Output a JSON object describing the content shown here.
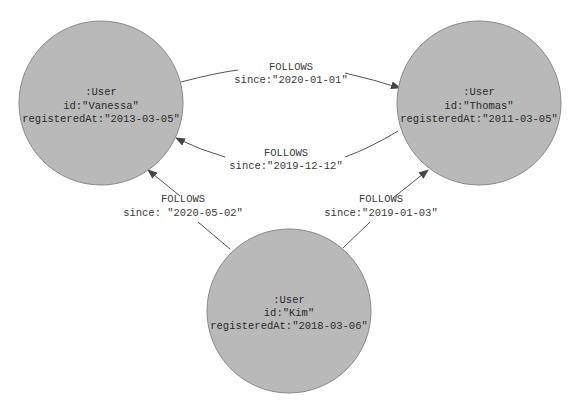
{
  "colors": {
    "node_fill": "#b9b9b9",
    "node_stroke": "#8a8a8a",
    "edge": "#555555",
    "background": "#ffffff"
  },
  "nodes": {
    "vanessa": {
      "label": ":User",
      "id": "id:\"Vanessa\"",
      "registered": "registeredAt:\"2013-03-05\""
    },
    "thomas": {
      "label": ":User",
      "id": "id:\"Thomas\"",
      "registered": "registeredAt:\"2011-03-05\""
    },
    "kim": {
      "label": ":User",
      "id": "id:\"Kim\"",
      "registered": "registeredAt:\"2018-03-06\""
    }
  },
  "edges": {
    "vanessa_to_thomas": {
      "type": "FOLLOWS",
      "since": "since:\"2020-01-01\""
    },
    "thomas_to_vanessa": {
      "type": "FOLLOWS",
      "since": "since:\"2019-12-12\""
    },
    "kim_to_vanessa": {
      "type": "FOLLOWS",
      "since": "since: \"2020-05-02\""
    },
    "kim_to_thomas": {
      "type": "FOLLOWS",
      "since": "since:\"2019-01-03\""
    }
  }
}
